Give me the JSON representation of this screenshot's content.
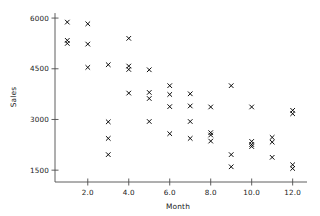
{
  "chart_data": {
    "type": "scatter",
    "title": "",
    "xlabel": "Month",
    "ylabel": "Sales",
    "xlim": [
      0.4,
      12.7
    ],
    "ylim": [
      1150,
      6150
    ],
    "grid": false,
    "legend": null,
    "marker": "x",
    "marker_color": "#000000",
    "x_ticks": [
      2.0,
      4.0,
      6.0,
      8.0,
      10.0,
      12.0
    ],
    "x_tick_labels": [
      "2.0",
      "4.0",
      "6.0",
      "8.0",
      "10.0",
      "12.0"
    ],
    "y_ticks": [
      1500,
      3000,
      4500,
      6000
    ],
    "y_tick_labels": [
      "1500",
      "3000",
      "4500",
      "6000"
    ],
    "points": [
      {
        "x": 1,
        "y": 5880
      },
      {
        "x": 1,
        "y": 5340
      },
      {
        "x": 1,
        "y": 5250
      },
      {
        "x": 2,
        "y": 5830
      },
      {
        "x": 2,
        "y": 5230
      },
      {
        "x": 2,
        "y": 4540
      },
      {
        "x": 3,
        "y": 4620
      },
      {
        "x": 3,
        "y": 2930
      },
      {
        "x": 3,
        "y": 2440
      },
      {
        "x": 3,
        "y": 1960
      },
      {
        "x": 4,
        "y": 5400
      },
      {
        "x": 4,
        "y": 4580
      },
      {
        "x": 4,
        "y": 4480
      },
      {
        "x": 4,
        "y": 3780
      },
      {
        "x": 5,
        "y": 4470
      },
      {
        "x": 5,
        "y": 3800
      },
      {
        "x": 5,
        "y": 3620
      },
      {
        "x": 5,
        "y": 2940
      },
      {
        "x": 6,
        "y": 4000
      },
      {
        "x": 6,
        "y": 3740
      },
      {
        "x": 6,
        "y": 3380
      },
      {
        "x": 6,
        "y": 2580
      },
      {
        "x": 7,
        "y": 3760
      },
      {
        "x": 7,
        "y": 3400
      },
      {
        "x": 7,
        "y": 2940
      },
      {
        "x": 7,
        "y": 2440
      },
      {
        "x": 8,
        "y": 3370
      },
      {
        "x": 8,
        "y": 2610
      },
      {
        "x": 8,
        "y": 2540
      },
      {
        "x": 8,
        "y": 2360
      },
      {
        "x": 9,
        "y": 4000
      },
      {
        "x": 9,
        "y": 1960
      },
      {
        "x": 9,
        "y": 1600
      },
      {
        "x": 10,
        "y": 3370
      },
      {
        "x": 10,
        "y": 2350
      },
      {
        "x": 10,
        "y": 2260
      },
      {
        "x": 10,
        "y": 2200
      },
      {
        "x": 11,
        "y": 2470
      },
      {
        "x": 11,
        "y": 2330
      },
      {
        "x": 11,
        "y": 1880
      },
      {
        "x": 12,
        "y": 3270
      },
      {
        "x": 12,
        "y": 3170
      },
      {
        "x": 12,
        "y": 1660
      },
      {
        "x": 12,
        "y": 1550
      }
    ]
  },
  "axes": {
    "x_title": "Month",
    "y_title": "Sales"
  }
}
